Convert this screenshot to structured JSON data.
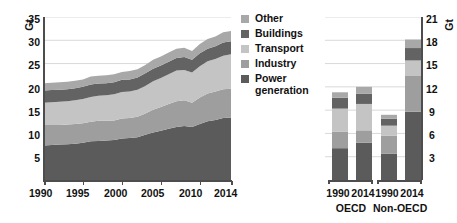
{
  "chart_data": [
    {
      "id": "global-co2-area",
      "type": "area",
      "title": "",
      "xlabel": "",
      "ylabel": "Gt",
      "unit": "Gt",
      "stacked": true,
      "grid": true,
      "legend_position": "right",
      "xlim": [
        1990,
        2014
      ],
      "ylim": [
        0,
        35
      ],
      "yticks": [
        5,
        10,
        15,
        20,
        25,
        30,
        35
      ],
      "xticks": [
        1990,
        1995,
        2000,
        2005,
        2010,
        2014
      ],
      "x": [
        1990,
        1991,
        1992,
        1993,
        1994,
        1995,
        1996,
        1997,
        1998,
        1999,
        2000,
        2001,
        2002,
        2003,
        2004,
        2005,
        2006,
        2007,
        2008,
        2009,
        2010,
        2011,
        2012,
        2013,
        2014
      ],
      "series": [
        {
          "name": "Power generation",
          "color": "#5b5b5b",
          "values": [
            7.4,
            7.5,
            7.6,
            7.7,
            7.8,
            8.0,
            8.3,
            8.4,
            8.5,
            8.6,
            8.9,
            9.0,
            9.2,
            9.7,
            10.2,
            10.6,
            11.0,
            11.4,
            11.6,
            11.4,
            12.0,
            12.6,
            12.9,
            13.3,
            13.4
          ]
        },
        {
          "name": "Industry",
          "color": "#9e9e9e",
          "values": [
            4.4,
            4.3,
            4.2,
            4.2,
            4.2,
            4.2,
            4.2,
            4.3,
            4.2,
            4.2,
            4.3,
            4.3,
            4.4,
            4.6,
            4.9,
            5.1,
            5.3,
            5.5,
            5.5,
            5.2,
            5.7,
            6.0,
            6.1,
            6.2,
            6.2
          ]
        },
        {
          "name": "Transport",
          "color": "#c4c4c4",
          "values": [
            4.8,
            4.9,
            5.0,
            5.0,
            5.1,
            5.2,
            5.3,
            5.4,
            5.5,
            5.6,
            5.7,
            5.7,
            5.8,
            5.9,
            6.1,
            6.2,
            6.4,
            6.6,
            6.5,
            6.5,
            6.7,
            6.9,
            7.0,
            7.2,
            7.4
          ]
        },
        {
          "name": "Buildings",
          "color": "#636363",
          "values": [
            2.6,
            2.6,
            2.6,
            2.6,
            2.6,
            2.6,
            2.7,
            2.6,
            2.6,
            2.6,
            2.6,
            2.6,
            2.6,
            2.7,
            2.7,
            2.7,
            2.7,
            2.7,
            2.8,
            2.7,
            2.8,
            2.7,
            2.7,
            2.8,
            2.8
          ]
        },
        {
          "name": "Other",
          "color": "#a8a8a8",
          "values": [
            1.6,
            1.6,
            1.6,
            1.6,
            1.6,
            1.6,
            1.7,
            1.7,
            1.7,
            1.7,
            1.7,
            1.8,
            1.8,
            1.8,
            1.9,
            1.9,
            2.0,
            2.0,
            2.0,
            1.9,
            2.0,
            2.1,
            2.1,
            2.2,
            2.2
          ]
        }
      ]
    },
    {
      "id": "oecd-nonoecd-bars",
      "type": "bar",
      "title": "",
      "xlabel": "",
      "ylabel": "Gt",
      "unit": "Gt",
      "stacked": true,
      "grid": true,
      "ylim": [
        0,
        21
      ],
      "yticks": [
        3,
        6,
        9,
        12,
        15,
        18,
        21
      ],
      "categories": [
        "1990",
        "2014",
        "1990",
        "2014"
      ],
      "groups": [
        {
          "name": "OECD",
          "categories": [
            "1990",
            "2014"
          ]
        },
        {
          "name": "Non-OECD",
          "categories": [
            "1990",
            "2014"
          ]
        }
      ],
      "series": [
        {
          "name": "Power generation",
          "color": "#5b5b5b",
          "values": [
            4.1,
            4.8,
            3.4,
            8.8
          ]
        },
        {
          "name": "Industry",
          "color": "#9e9e9e",
          "values": [
            2.1,
            1.6,
            2.3,
            4.6
          ]
        },
        {
          "name": "Transport",
          "color": "#c4c4c4",
          "values": [
            3.0,
            3.4,
            1.3,
            2.0
          ]
        },
        {
          "name": "Buildings",
          "color": "#636363",
          "values": [
            1.4,
            1.3,
            0.9,
            1.6
          ]
        },
        {
          "name": "Other",
          "color": "#a8a8a8",
          "values": [
            0.7,
            0.9,
            0.5,
            1.1
          ]
        }
      ]
    }
  ],
  "left_chart": {
    "unit_label": "Gt",
    "yticks": [
      "35",
      "30",
      "25",
      "20",
      "15",
      "10",
      "5"
    ],
    "xticks": [
      "1990",
      "1995",
      "2000",
      "2005",
      "2010",
      "2014"
    ]
  },
  "legend": {
    "items": [
      {
        "label": "Other",
        "color": "#a8a8a8"
      },
      {
        "label": "Buildings",
        "color": "#636363"
      },
      {
        "label": "Transport",
        "color": "#c4c4c4"
      },
      {
        "label": "Industry",
        "color": "#9e9e9e"
      },
      {
        "label": "Power\ngeneration",
        "color": "#5b5b5b"
      }
    ]
  },
  "right_chart": {
    "unit_label": "Gt",
    "yticks": [
      "21",
      "18",
      "15",
      "12",
      "9",
      "6",
      "3"
    ],
    "group_labels": [
      "OECD",
      "Non-OECD"
    ],
    "bar_labels": [
      "1990",
      "2014",
      "1990",
      "2014"
    ]
  }
}
